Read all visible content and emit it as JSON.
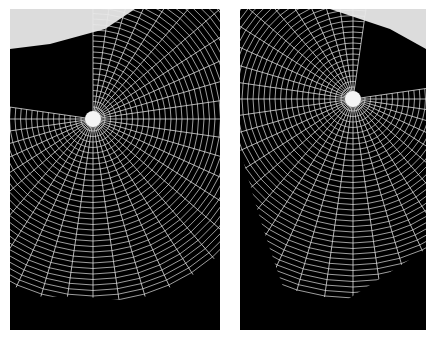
{
  "figure": {
    "panels": [
      {
        "id": "left",
        "subject": "spider web photograph",
        "hub": [
          83,
          110
        ],
        "radius": 185
      },
      {
        "id": "right",
        "subject": "spider web photograph",
        "hub": [
          113,
          90
        ],
        "radius": 200
      }
    ],
    "colors": {
      "background": "#000000",
      "silk": "#e8e8e8",
      "page": "#ffffff"
    }
  }
}
